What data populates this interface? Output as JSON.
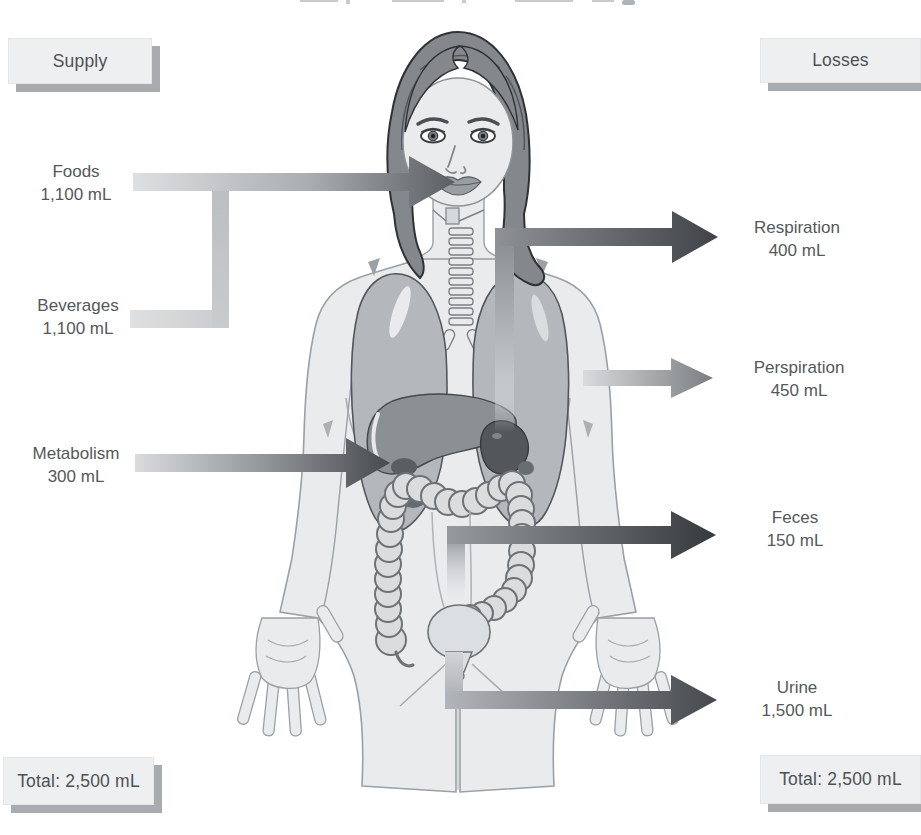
{
  "diagram_title_remnant": "",
  "supply": {
    "box_label": "Supply",
    "items": [
      {
        "name": "foods",
        "label": "Foods",
        "value": "1,100 mL"
      },
      {
        "name": "beverages",
        "label": "Beverages",
        "value": "1,100 mL"
      },
      {
        "name": "metabolism",
        "label": "Metabolism",
        "value": "300 mL"
      }
    ],
    "total_label": "Total: 2,500 mL"
  },
  "losses": {
    "box_label": "Losses",
    "items": [
      {
        "name": "respiration",
        "label": "Respiration",
        "value": "400 mL"
      },
      {
        "name": "perspiration",
        "label": "Perspiration",
        "value": "450 mL"
      },
      {
        "name": "feces",
        "label": "Feces",
        "value": "150 mL"
      },
      {
        "name": "urine",
        "label": "Urine",
        "value": "1,500 mL"
      }
    ],
    "total_label": "Total: 2,500 mL"
  },
  "colors": {
    "label_text": "#54585c",
    "box_background": "#edeff0",
    "box_shadow": "#a9acaf",
    "arrow_light": "#dcdee0",
    "arrow_dark": "#3f4347",
    "body_fill": "#e9ebed",
    "body_outline": "#9aa0a4",
    "hair": "#84888c",
    "lungs": "#b4b8bc",
    "liver": "#8b9094",
    "stomach": "#53575b",
    "intestine": "#dadcde"
  }
}
